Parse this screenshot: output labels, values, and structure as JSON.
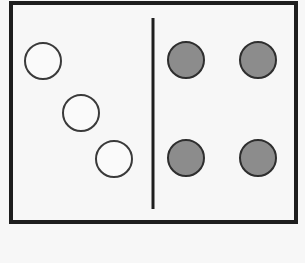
{
  "diagram": {
    "frame": {
      "x": 11,
      "y": 3,
      "width": 285,
      "height": 219,
      "stroke": "#1e1e1e",
      "stroke_width": 4
    },
    "divider": {
      "x": 153,
      "y1": 18,
      "y2": 209,
      "stroke": "#1e1e1e",
      "stroke_width": 3
    },
    "left_group": {
      "label": "open circles",
      "fill": "#fafafa",
      "stroke": "#3a3a3a",
      "circles": [
        {
          "cx": 43,
          "cy": 61,
          "r": 18
        },
        {
          "cx": 81,
          "cy": 113,
          "r": 18
        },
        {
          "cx": 114,
          "cy": 159,
          "r": 18
        }
      ]
    },
    "right_group": {
      "label": "filled circles",
      "fill": "#8c8c8c",
      "stroke": "#2e2e2e",
      "circles": [
        {
          "cx": 186,
          "cy": 60,
          "r": 18
        },
        {
          "cx": 258,
          "cy": 60,
          "r": 18
        },
        {
          "cx": 186,
          "cy": 158,
          "r": 18
        },
        {
          "cx": 258,
          "cy": 158,
          "r": 18
        }
      ]
    }
  }
}
